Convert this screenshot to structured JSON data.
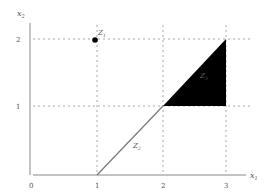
{
  "axes": {
    "x_label": "x",
    "x_label_sub": "1",
    "y_label": "x",
    "y_label_sub": "2",
    "origin_label": "0",
    "x_ticks": [
      "1",
      "2",
      "3"
    ],
    "y_ticks": [
      "1",
      "2"
    ]
  },
  "sets": {
    "z1": {
      "name": "Z",
      "sub": "1",
      "type": "point",
      "coords": [
        1,
        2
      ]
    },
    "z2": {
      "name": "Z",
      "sub": "2",
      "type": "segment",
      "from": [
        1,
        0
      ],
      "to": [
        2,
        1
      ]
    },
    "z3": {
      "name": "Z",
      "sub": "3",
      "type": "filled-triangle",
      "vertices": [
        [
          2,
          1
        ],
        [
          3,
          1
        ],
        [
          3,
          2
        ]
      ]
    }
  },
  "colors": {
    "axis": "#888888",
    "grid": "#aaaaaa",
    "fill": "#000000",
    "label": "#555555"
  }
}
